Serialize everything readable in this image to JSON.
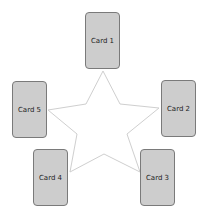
{
  "diagram": {
    "shape": "star",
    "star_stroke_color": "#cfcfcf",
    "card_fill_color": "#cdcdcd",
    "card_border_color": "#7a7a7a",
    "cards": [
      {
        "label": "Card 1",
        "x": 85,
        "y": 12
      },
      {
        "label": "Card 2",
        "x": 161,
        "y": 80
      },
      {
        "label": "Card 3",
        "x": 140,
        "y": 149
      },
      {
        "label": "Card 4",
        "x": 33,
        "y": 149
      },
      {
        "label": "Card 5",
        "x": 12,
        "y": 81
      }
    ]
  }
}
